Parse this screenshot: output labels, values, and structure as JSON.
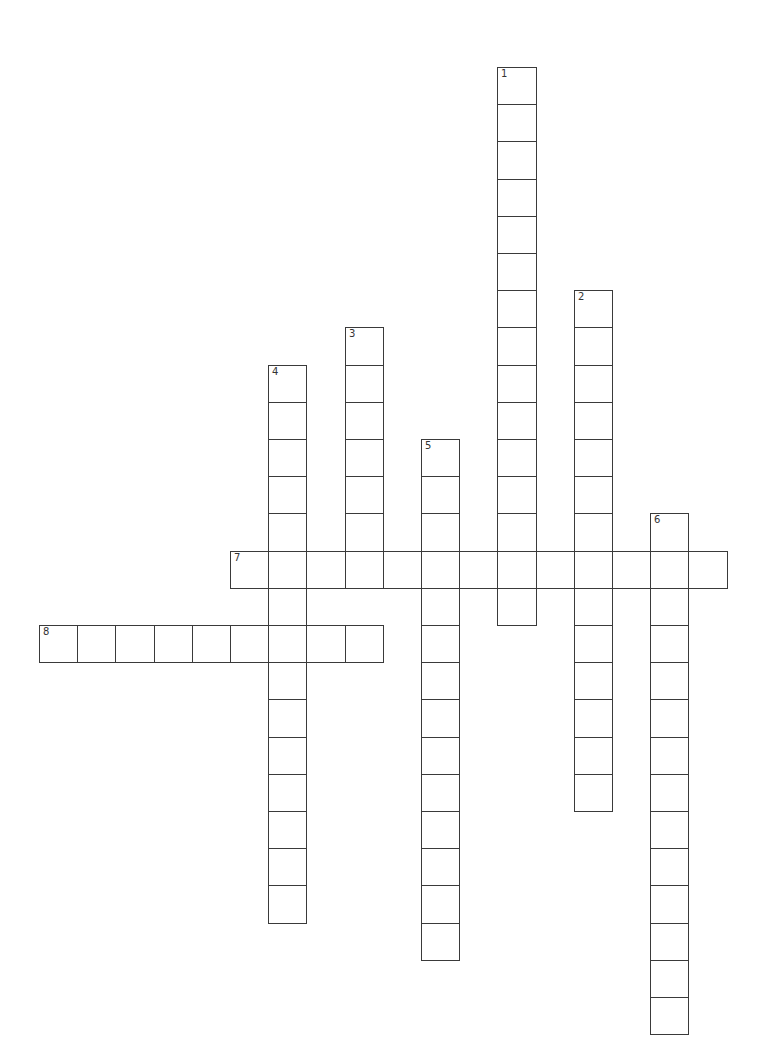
{
  "puzzle": {
    "type": "crossword",
    "grid": {
      "origin_x": 39,
      "origin_y": 67,
      "cell_w": 38.2,
      "cell_h": 37.2,
      "border_color": "#3a3a3a"
    },
    "words": [
      {
        "number": "1",
        "direction": "down",
        "col": 12,
        "row": 0,
        "length": 15
      },
      {
        "number": "2",
        "direction": "down",
        "col": 14,
        "row": 6,
        "length": 14
      },
      {
        "number": "3",
        "direction": "down",
        "col": 8,
        "row": 7,
        "length": 7
      },
      {
        "number": "4",
        "direction": "down",
        "col": 6,
        "row": 8,
        "length": 15
      },
      {
        "number": "5",
        "direction": "down",
        "col": 10,
        "row": 10,
        "length": 14
      },
      {
        "number": "6",
        "direction": "down",
        "col": 16,
        "row": 12,
        "length": 14
      },
      {
        "number": "7",
        "direction": "across",
        "col": 5,
        "row": 13,
        "length": 13
      },
      {
        "number": "8",
        "direction": "across",
        "col": 0,
        "row": 15,
        "length": 9
      }
    ]
  }
}
